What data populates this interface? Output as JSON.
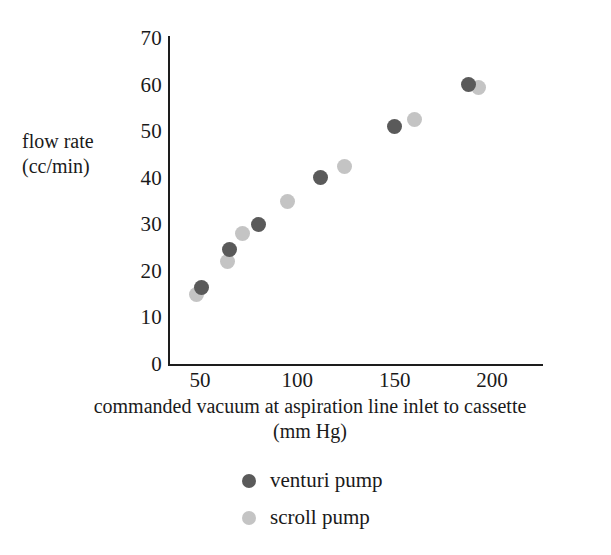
{
  "chart_data": {
    "type": "scatter",
    "title": "",
    "xlabel": "commanded vacuum at aspiration line inlet to cassette (mm Hg)",
    "xlabel_line1": "commanded vacuum at aspiration line inlet to cassette",
    "xlabel_line2": "(mm Hg)",
    "ylabel": "flow rate (cc/min)",
    "ylabel_line1": "flow rate",
    "ylabel_line2": "(cc/min)",
    "xlim": [
      30,
      228
    ],
    "ylim": [
      0,
      70
    ],
    "xticks": [
      50,
      100,
      150,
      200
    ],
    "yticks": [
      0,
      10,
      20,
      30,
      40,
      50,
      60,
      70
    ],
    "grid": false,
    "legend_position": "bottom-center",
    "series": [
      {
        "name": "venturi pump",
        "color": "#5a5a5a",
        "marker": "circle",
        "points": [
          {
            "x": 51,
            "y": 16.5
          },
          {
            "x": 65,
            "y": 24.5
          },
          {
            "x": 80,
            "y": 30.0
          },
          {
            "x": 112,
            "y": 40.0
          },
          {
            "x": 150,
            "y": 51.0
          },
          {
            "x": 188,
            "y": 60.0
          }
        ]
      },
      {
        "name": "scroll pump",
        "color": "#c4c4c4",
        "marker": "circle",
        "points": [
          {
            "x": 48,
            "y": 15.0
          },
          {
            "x": 64,
            "y": 22.0
          },
          {
            "x": 72,
            "y": 28.0
          },
          {
            "x": 95,
            "y": 35.0
          },
          {
            "x": 124,
            "y": 42.5
          },
          {
            "x": 160,
            "y": 52.5
          },
          {
            "x": 193,
            "y": 59.3
          }
        ]
      }
    ]
  },
  "legend": {
    "items": [
      {
        "label": "venturi pump",
        "color": "#5a5a5a"
      },
      {
        "label": "scroll pump",
        "color": "#c4c4c4"
      }
    ]
  },
  "colors": {
    "background": "#ffffff",
    "axis": "#1d1d1d",
    "text": "#1a1a1a",
    "venturi": "#5a5a5a",
    "scroll": "#c4c4c4"
  }
}
